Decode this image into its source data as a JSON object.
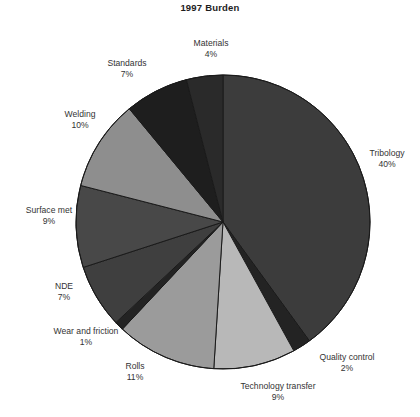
{
  "chart_data": {
    "type": "pie",
    "title": "1997 Burden",
    "xlabel": "",
    "ylabel": "",
    "legend": "none",
    "grid": false,
    "start_angle_deg": 0,
    "direction": "clockwise",
    "categories": [
      "Tribology",
      "Quality control",
      "Technology transfer",
      "Rolls",
      "Wear and friction",
      "NDE",
      "Surface met",
      "Welding",
      "Standards",
      "Materials"
    ],
    "values": [
      40,
      2,
      9,
      11,
      1,
      7,
      9,
      10,
      7,
      4
    ],
    "unit": "%",
    "slices": [
      {
        "name": "Tribology",
        "value": 40,
        "value_label": "40%",
        "color": "#3c3c3c"
      },
      {
        "name": "Quality control",
        "value": 2,
        "value_label": "2%",
        "color": "#232323"
      },
      {
        "name": "Technology transfer",
        "value": 9,
        "value_label": "9%",
        "color": "#b8b8b8"
      },
      {
        "name": "Rolls",
        "value": 11,
        "value_label": "11%",
        "color": "#9b9b9b"
      },
      {
        "name": "Wear and friction",
        "value": 1,
        "value_label": "1%",
        "color": "#232323"
      },
      {
        "name": "NDE",
        "value": 7,
        "value_label": "7%",
        "color": "#3f3f3f"
      },
      {
        "name": "Surface met",
        "value": 9,
        "value_label": "9%",
        "color": "#484848"
      },
      {
        "name": "Welding",
        "value": 10,
        "value_label": "10%",
        "color": "#8e8e8e"
      },
      {
        "name": "Standards",
        "value": 7,
        "value_label": "7%",
        "color": "#1e1e1e"
      },
      {
        "name": "Materials",
        "value": 4,
        "value_label": "4%",
        "color": "#2a2a2a"
      }
    ]
  },
  "labels": {
    "materials": {
      "name": "Materials",
      "value": "4%"
    },
    "standards": {
      "name": "Standards",
      "value": "7%"
    },
    "welding": {
      "name": "Welding",
      "value": "10%"
    },
    "surface_met": {
      "name": "Surface met",
      "value": "9%"
    },
    "nde": {
      "name": "NDE",
      "value": "7%"
    },
    "wear_and_friction": {
      "name": "Wear and friction",
      "value": "1%"
    },
    "rolls": {
      "name": "Rolls",
      "value": "11%"
    },
    "technology_transfer": {
      "name": "Technology transfer",
      "value": "9%"
    },
    "quality_control": {
      "name": "Quality control",
      "value": "2%"
    },
    "tribology": {
      "name": "Tribology",
      "value": "40%"
    }
  },
  "geometry": {
    "center_x": 223,
    "center_y": 222,
    "radius": 147
  },
  "colors": {
    "background": "#ffffff",
    "outline": "#1a1a1a",
    "text": "#333333"
  }
}
